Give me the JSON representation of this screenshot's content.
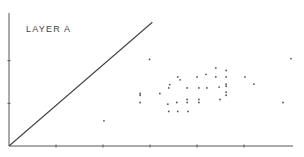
{
  "chart_data": {
    "type": "scatter",
    "title": "LAYER A",
    "xlabel": "",
    "ylabel": "",
    "grid": false,
    "axis_color": "#555555",
    "point_color": "#555555",
    "xlim": [
      0,
      6
    ],
    "ylim": [
      0,
      3
    ],
    "x_ticks": [
      1,
      2,
      3,
      4,
      5
    ],
    "y_ticks": [
      1,
      2
    ],
    "reference_line": {
      "from": [
        0,
        0
      ],
      "to": [
        3.05,
        2.9
      ]
    },
    "points": [
      {
        "x": 2.99,
        "y": 2.03
      },
      {
        "x": 2.02,
        "y": 0.59
      },
      {
        "x": 2.79,
        "y": 1.23
      },
      {
        "x": 2.79,
        "y": 1.19
      },
      {
        "x": 2.79,
        "y": 1.02
      },
      {
        "x": 3.21,
        "y": 1.23
      },
      {
        "x": 3.4,
        "y": 1.36
      },
      {
        "x": 3.42,
        "y": 1.44
      },
      {
        "x": 3.38,
        "y": 0.98
      },
      {
        "x": 3.4,
        "y": 0.81
      },
      {
        "x": 3.59,
        "y": 1.62
      },
      {
        "x": 3.64,
        "y": 1.55
      },
      {
        "x": 3.57,
        "y": 1.02
      },
      {
        "x": 3.59,
        "y": 0.81
      },
      {
        "x": 3.79,
        "y": 1.36
      },
      {
        "x": 3.79,
        "y": 1.09
      },
      {
        "x": 3.79,
        "y": 1.02
      },
      {
        "x": 3.81,
        "y": 0.81
      },
      {
        "x": 4.0,
        "y": 1.62
      },
      {
        "x": 4.04,
        "y": 1.36
      },
      {
        "x": 4.04,
        "y": 1.09
      },
      {
        "x": 4.04,
        "y": 1.02
      },
      {
        "x": 4.19,
        "y": 1.68
      },
      {
        "x": 4.21,
        "y": 1.36
      },
      {
        "x": 4.4,
        "y": 1.83
      },
      {
        "x": 4.4,
        "y": 1.62
      },
      {
        "x": 4.47,
        "y": 1.38
      },
      {
        "x": 4.49,
        "y": 1.09
      },
      {
        "x": 4.62,
        "y": 1.77
      },
      {
        "x": 4.62,
        "y": 1.62
      },
      {
        "x": 4.62,
        "y": 1.45
      },
      {
        "x": 4.62,
        "y": 1.4
      },
      {
        "x": 4.62,
        "y": 1.26
      },
      {
        "x": 4.62,
        "y": 1.19
      },
      {
        "x": 5.02,
        "y": 1.62
      },
      {
        "x": 5.21,
        "y": 1.45
      },
      {
        "x": 5.83,
        "y": 1.02
      },
      {
        "x": 6.0,
        "y": 2.05
      }
    ]
  }
}
